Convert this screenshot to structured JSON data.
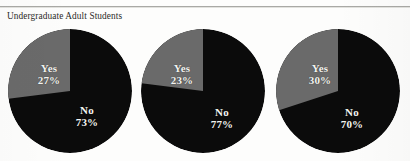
{
  "figure": {
    "caption": "Undergraduate Adult Students",
    "rule_color": "#a9a9a5",
    "background_color": "#fdfdfc"
  },
  "colors": {
    "yes_slice": "#6a6a6a",
    "no_slice": "#0b0b0b",
    "label_text": "#f4f4f1",
    "caption_text": "#2b2b28"
  },
  "chart_data": [
    {
      "type": "pie",
      "title": "Undergraduate Adult Students",
      "labels": [
        "Yes",
        "No"
      ],
      "values": [
        27,
        73
      ],
      "value_labels": [
        "27%",
        "70%"
      ],
      "slice_colors": [
        "#6a6a6a",
        "#0b0b0b"
      ],
      "legend": "none",
      "start_angle": 0,
      "direction": "counterclockwise"
    },
    {
      "type": "pie",
      "title": "",
      "labels": [
        "Yes",
        "No"
      ],
      "values": [
        23,
        77
      ],
      "value_labels": [
        "23%",
        "77%"
      ],
      "slice_colors": [
        "#6a6a6a",
        "#0b0b0b"
      ],
      "legend": "none",
      "start_angle": 0,
      "direction": "counterclockwise"
    },
    {
      "type": "pie",
      "title": "",
      "labels": [
        "Yes",
        "No"
      ],
      "values": [
        30,
        70
      ],
      "value_labels": [
        "30%",
        "70%"
      ],
      "slice_colors": [
        "#6a6a6a",
        "#0b0b0b"
      ],
      "legend": "none",
      "start_angle": 0,
      "direction": "counterclockwise"
    }
  ],
  "pies": [
    {
      "yes_label": "Yes",
      "yes_pct": "27%",
      "no_label": "No",
      "no_pct": "73%"
    },
    {
      "yes_label": "Yes",
      "yes_pct": "23%",
      "no_label": "No",
      "no_pct": "77%"
    },
    {
      "yes_label": "Yes",
      "yes_pct": "30%",
      "no_label": "No",
      "no_pct": "70%"
    }
  ]
}
